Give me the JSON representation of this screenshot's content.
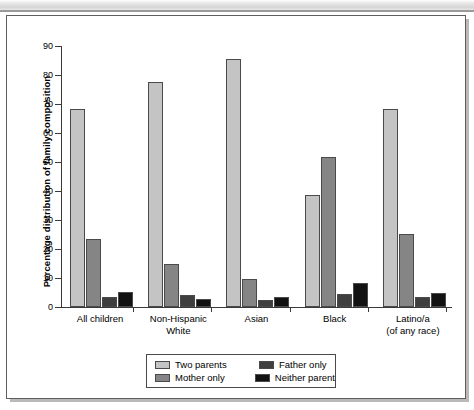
{
  "chart_data": {
    "type": "bar",
    "title": "",
    "xlabel": "",
    "ylabel": "Percentage distribution of family composition",
    "ylim": [
      0,
      90
    ],
    "ytick_step": 10,
    "yticks": [
      0,
      10,
      20,
      30,
      40,
      50,
      60,
      70,
      80,
      90
    ],
    "grid": false,
    "legend_position": "bottom-center",
    "categories": [
      "All children",
      "Non-Hispanic\nWhite",
      "Asian",
      "Black",
      "Latino/a\n(of any race)"
    ],
    "category_lines": [
      [
        "All children"
      ],
      [
        "Non-Hispanic",
        "White"
      ],
      [
        "Asian"
      ],
      [
        "Black"
      ],
      [
        "Latino/a",
        "(of any race)"
      ]
    ],
    "series": [
      {
        "name": "Two parents",
        "color": "#c4c4c4",
        "values": [
          68.3,
          77.7,
          85.6,
          38.5,
          68.4
        ]
      },
      {
        "name": "Mother only",
        "color": "#858585",
        "values": [
          23.4,
          14.9,
          9.6,
          51.6,
          25.2
        ]
      },
      {
        "name": "Father only",
        "color": "#3f3f3f",
        "values": [
          3.6,
          4.2,
          2.4,
          4.5,
          3.5
        ]
      },
      {
        "name": "Neither parent",
        "color": "#121212",
        "values": [
          5.1,
          2.6,
          3.3,
          8.3,
          4.8
        ]
      }
    ]
  },
  "legend": {
    "entries": [
      {
        "label": "Two parents",
        "color": "#c4c4c4"
      },
      {
        "label": "Father only",
        "color": "#3f3f3f"
      },
      {
        "label": "Mother only",
        "color": "#858585"
      },
      {
        "label": "Neither parent",
        "color": "#121212"
      }
    ]
  }
}
